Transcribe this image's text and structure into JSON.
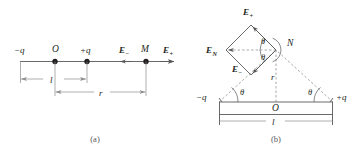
{
  "figure": {
    "panels": [
      {
        "id": "a",
        "caption": "(a)",
        "labels": {
          "charge_negative": "−q",
          "origin": "O",
          "charge_positive": "+q",
          "field_minus": "E",
          "field_minus_sub": "−",
          "point_m": "M",
          "field_plus": "E",
          "field_plus_sub": "+",
          "dim_l": "l",
          "dim_r": "r"
        }
      },
      {
        "id": "b",
        "caption": "(b)",
        "labels": {
          "field_plus": "E",
          "field_plus_sub": "+",
          "field_minus": "E",
          "field_minus_sub": "−",
          "field_n": "E",
          "field_n_sub": "N",
          "point_n": "N",
          "angle_upper": "θ",
          "angle_lower": "θ",
          "angle_left": "θ",
          "angle_right": "θ",
          "charge_negative": "−q",
          "charge_positive": "+q",
          "origin": "O",
          "dim_r": "r",
          "dim_l": "l"
        }
      }
    ],
    "colors": {
      "ink": "#231f20",
      "line": "#58595b",
      "dim": "#8c8c8c",
      "dash": "#808285",
      "background": "#ffffff"
    }
  }
}
